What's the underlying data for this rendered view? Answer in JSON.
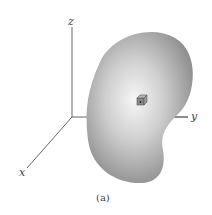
{
  "axes": {
    "x_label": "x",
    "y_label": "y",
    "z_label": "z"
  },
  "caption": "(a)",
  "colors": {
    "axis": "#666666",
    "body_edge": "#8a8a8a",
    "body_center": "#f4f4f4",
    "cube": "#7a7a7a"
  }
}
